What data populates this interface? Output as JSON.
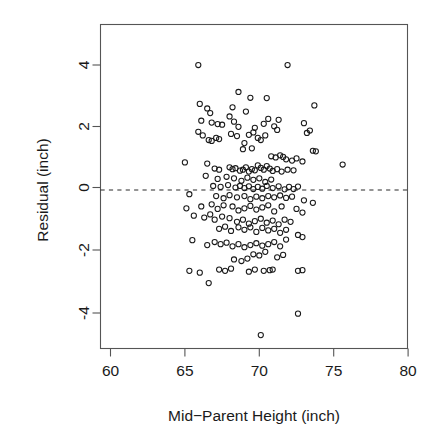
{
  "chart_data": {
    "type": "scatter",
    "title": "",
    "xlabel": "Mid−Parent Height (inch)",
    "ylabel": "Residual (inch)",
    "xlim": [
      59.3,
      80.7
    ],
    "ylim": [
      -5.2,
      5.3
    ],
    "xticks": [
      60,
      65,
      70,
      75,
      80
    ],
    "xtick_labels": [
      "60",
      "65",
      "70",
      "75",
      "80"
    ],
    "yticks": [
      -4,
      -2,
      0,
      2,
      4
    ],
    "ytick_labels": [
      "-4",
      "-2",
      "0",
      "2",
      "4"
    ],
    "grid": false,
    "legend": "none",
    "marker": "open-circle",
    "marker_color": "#1a1a1a",
    "reference_line": {
      "type": "horizontal-dashed",
      "y": -0.08,
      "label": "zero residual line"
    },
    "n_points": 205,
    "points": [
      [
        65.9,
        4.0
      ],
      [
        71.9,
        4.0
      ],
      [
        68.6,
        3.12
      ],
      [
        69.4,
        2.93
      ],
      [
        70.5,
        2.92
      ],
      [
        73.7,
        2.68
      ],
      [
        66.0,
        2.73
      ],
      [
        66.5,
        2.58
      ],
      [
        66.7,
        2.43
      ],
      [
        68.2,
        2.62
      ],
      [
        69.1,
        2.48
      ],
      [
        66.1,
        2.18
      ],
      [
        66.8,
        2.12
      ],
      [
        67.2,
        2.07
      ],
      [
        67.5,
        2.05
      ],
      [
        68.0,
        2.32
      ],
      [
        68.3,
        2.15
      ],
      [
        68.6,
        1.98
      ],
      [
        69.7,
        1.95
      ],
      [
        70.3,
        2.08
      ],
      [
        70.6,
        2.24
      ],
      [
        71.0,
        2.0
      ],
      [
        71.3,
        2.21
      ],
      [
        71.2,
        1.88
      ],
      [
        73.0,
        2.1
      ],
      [
        73.4,
        1.86
      ],
      [
        73.2,
        1.78
      ],
      [
        65.9,
        1.82
      ],
      [
        66.2,
        1.7
      ],
      [
        66.6,
        1.55
      ],
      [
        66.8,
        1.52
      ],
      [
        67.1,
        1.62
      ],
      [
        67.3,
        1.58
      ],
      [
        68.1,
        1.75
      ],
      [
        68.5,
        1.68
      ],
      [
        69.0,
        1.45
      ],
      [
        69.3,
        1.72
      ],
      [
        69.6,
        1.8
      ],
      [
        69.9,
        1.62
      ],
      [
        70.1,
        1.55
      ],
      [
        70.4,
        1.7
      ],
      [
        68.9,
        1.25
      ],
      [
        69.5,
        1.28
      ],
      [
        73.6,
        1.2
      ],
      [
        73.8,
        1.18
      ],
      [
        70.8,
        1.02
      ],
      [
        71.1,
        0.98
      ],
      [
        71.4,
        1.05
      ],
      [
        71.6,
        1.0
      ],
      [
        71.8,
        0.92
      ],
      [
        72.2,
        0.88
      ],
      [
        72.5,
        0.95
      ],
      [
        72.9,
        0.85
      ],
      [
        65.0,
        0.82
      ],
      [
        66.5,
        0.78
      ],
      [
        67.0,
        0.62
      ],
      [
        67.3,
        0.58
      ],
      [
        68.0,
        0.66
      ],
      [
        68.2,
        0.6
      ],
      [
        68.4,
        0.63
      ],
      [
        68.7,
        0.55
      ],
      [
        68.9,
        0.58
      ],
      [
        69.1,
        0.66
      ],
      [
        69.3,
        0.52
      ],
      [
        69.5,
        0.6
      ],
      [
        69.7,
        0.56
      ],
      [
        69.9,
        0.72
      ],
      [
        70.1,
        0.64
      ],
      [
        70.3,
        0.58
      ],
      [
        70.5,
        0.7
      ],
      [
        70.7,
        0.62
      ],
      [
        70.9,
        0.54
      ],
      [
        71.2,
        0.6
      ],
      [
        71.5,
        0.52
      ],
      [
        71.9,
        0.58
      ],
      [
        72.3,
        0.56
      ],
      [
        75.6,
        0.75
      ],
      [
        66.4,
        0.38
      ],
      [
        67.2,
        0.28
      ],
      [
        67.8,
        0.35
      ],
      [
        68.3,
        0.3
      ],
      [
        68.8,
        0.22
      ],
      [
        69.2,
        0.32
      ],
      [
        69.6,
        0.25
      ],
      [
        70.0,
        0.3
      ],
      [
        70.4,
        0.18
      ],
      [
        70.8,
        0.26
      ],
      [
        66.9,
        0.05
      ],
      [
        67.4,
        0.02
      ],
      [
        67.9,
        0.08
      ],
      [
        68.4,
        0.0
      ],
      [
        68.7,
        0.05
      ],
      [
        69.0,
        -0.02
      ],
      [
        69.3,
        0.04
      ],
      [
        69.6,
        -0.05
      ],
      [
        69.9,
        0.02
      ],
      [
        70.2,
        -0.04
      ],
      [
        70.5,
        0.05
      ],
      [
        70.9,
        -0.02
      ],
      [
        71.3,
        0.04
      ],
      [
        71.7,
        -0.06
      ],
      [
        72.0,
        0.02
      ],
      [
        72.3,
        -0.05
      ],
      [
        72.6,
        0.03
      ],
      [
        65.3,
        -0.22
      ],
      [
        67.1,
        -0.28
      ],
      [
        67.6,
        -0.35
      ],
      [
        68.0,
        -0.25
      ],
      [
        68.5,
        -0.32
      ],
      [
        69.0,
        -0.28
      ],
      [
        69.4,
        -0.38
      ],
      [
        69.8,
        -0.3
      ],
      [
        70.2,
        -0.35
      ],
      [
        70.6,
        -0.28
      ],
      [
        71.0,
        -0.32
      ],
      [
        71.4,
        -0.26
      ],
      [
        71.8,
        -0.34
      ],
      [
        72.2,
        -0.3
      ],
      [
        73.0,
        -0.42
      ],
      [
        73.6,
        -0.5
      ],
      [
        65.1,
        -0.68
      ],
      [
        66.1,
        -0.62
      ],
      [
        66.8,
        -0.55
      ],
      [
        67.2,
        -0.7
      ],
      [
        67.6,
        -0.58
      ],
      [
        68.2,
        -0.62
      ],
      [
        68.6,
        -0.75
      ],
      [
        69.0,
        -0.68
      ],
      [
        69.4,
        -0.6
      ],
      [
        69.8,
        -0.72
      ],
      [
        70.2,
        -0.65
      ],
      [
        70.6,
        -0.58
      ],
      [
        71.0,
        -0.78
      ],
      [
        71.5,
        -0.62
      ],
      [
        72.5,
        -0.7
      ],
      [
        72.9,
        -0.82
      ],
      [
        65.6,
        -0.92
      ],
      [
        66.3,
        -0.98
      ],
      [
        66.7,
        -0.88
      ],
      [
        67.0,
        -1.05
      ],
      [
        67.5,
        -0.95
      ],
      [
        68.0,
        -1.0
      ],
      [
        68.5,
        -1.12
      ],
      [
        68.9,
        -1.05
      ],
      [
        69.3,
        -1.18
      ],
      [
        69.7,
        -1.1
      ],
      [
        70.1,
        -1.02
      ],
      [
        70.5,
        -1.15
      ],
      [
        70.9,
        -1.08
      ],
      [
        71.3,
        -1.2
      ],
      [
        71.7,
        -1.05
      ],
      [
        72.1,
        -1.12
      ],
      [
        67.3,
        -1.35
      ],
      [
        67.7,
        -1.28
      ],
      [
        68.1,
        -1.42
      ],
      [
        68.6,
        -1.3
      ],
      [
        69.0,
        -1.38
      ],
      [
        69.4,
        -1.3
      ],
      [
        69.8,
        -1.45
      ],
      [
        70.2,
        -1.32
      ],
      [
        70.6,
        -1.4
      ],
      [
        71.0,
        -1.35
      ],
      [
        71.4,
        -1.48
      ],
      [
        71.8,
        -1.38
      ],
      [
        72.6,
        -1.55
      ],
      [
        72.9,
        -1.62
      ],
      [
        65.5,
        -1.72
      ],
      [
        66.5,
        -1.88
      ],
      [
        67.0,
        -1.78
      ],
      [
        67.4,
        -1.85
      ],
      [
        67.8,
        -1.8
      ],
      [
        68.2,
        -1.92
      ],
      [
        68.6,
        -1.85
      ],
      [
        69.0,
        -1.95
      ],
      [
        69.4,
        -1.88
      ],
      [
        69.8,
        -1.82
      ],
      [
        70.2,
        -1.9
      ],
      [
        70.6,
        -1.85
      ],
      [
        71.0,
        -1.78
      ],
      [
        71.4,
        -1.92
      ],
      [
        71.8,
        -1.7
      ],
      [
        69.6,
        -2.18
      ],
      [
        70.0,
        -2.22
      ],
      [
        70.4,
        -2.1
      ],
      [
        71.2,
        -2.28
      ],
      [
        71.6,
        -2.2
      ],
      [
        68.3,
        -2.35
      ],
      [
        68.8,
        -2.4
      ],
      [
        69.2,
        -2.32
      ],
      [
        65.3,
        -2.72
      ],
      [
        66.0,
        -2.78
      ],
      [
        67.3,
        -2.68
      ],
      [
        67.7,
        -2.72
      ],
      [
        68.1,
        -2.65
      ],
      [
        69.3,
        -2.75
      ],
      [
        69.7,
        -2.68
      ],
      [
        70.3,
        -2.72
      ],
      [
        70.7,
        -2.7
      ],
      [
        70.9,
        -2.68
      ],
      [
        72.6,
        -2.72
      ],
      [
        72.9,
        -2.7
      ],
      [
        66.6,
        -3.12
      ],
      [
        72.6,
        -4.12
      ],
      [
        70.1,
        -4.82
      ]
    ]
  },
  "figure": {
    "background_color": "#ffffff",
    "frame_color": "#555555",
    "point_color": "#1a1a1a",
    "point_radius": 2.6
  }
}
